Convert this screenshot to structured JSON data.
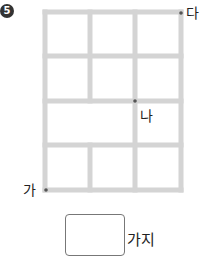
{
  "problem": {
    "number": "5",
    "number_glyph": "⑤",
    "labels": {
      "start": "가",
      "middle": "나",
      "end": "다"
    },
    "answer_value": "",
    "unit": "가지"
  },
  "grid": {
    "line_color": "#d4d4d4",
    "dot_color": "#555555",
    "rows": 4,
    "cols": 3,
    "note": "third row has the left two cells merged"
  }
}
